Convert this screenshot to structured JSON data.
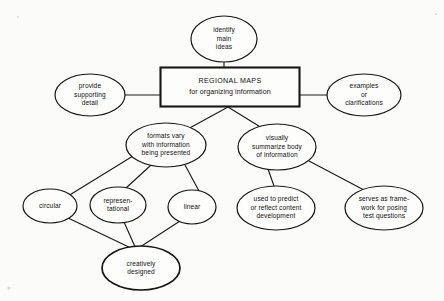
{
  "diagram": {
    "root": {
      "id": "regional-maps",
      "shape": "rectangle",
      "line1": "REGIONAL MAPS",
      "line2": "for organizing information",
      "x": 230,
      "y": 87,
      "w": 139,
      "h": 39
    },
    "nodes": [
      {
        "id": "identify-main-ideas",
        "shape": "ellipse",
        "lines": [
          "identify",
          "main",
          "ideas"
        ],
        "cx": 224,
        "cy": 39,
        "rx": 33,
        "ry": 23,
        "emphasis": "normal"
      },
      {
        "id": "provide-supporting-detail",
        "shape": "ellipse",
        "lines": [
          "provide",
          "supporting",
          "detail"
        ],
        "cx": 90,
        "cy": 95,
        "rx": 35,
        "ry": 21,
        "emphasis": "normal"
      },
      {
        "id": "examples-or-clarifications",
        "shape": "ellipse",
        "lines": [
          "examples",
          "or",
          "clarifications"
        ],
        "cx": 364,
        "cy": 95,
        "rx": 37,
        "ry": 21,
        "emphasis": "normal"
      },
      {
        "id": "formats-vary",
        "shape": "ellipse",
        "lines": [
          "formats vary",
          "with information",
          "being presented"
        ],
        "cx": 166,
        "cy": 145,
        "rx": 40,
        "ry": 22,
        "emphasis": "normal"
      },
      {
        "id": "visually-summarize",
        "shape": "ellipse",
        "lines": [
          "visually",
          "summarize body",
          "of information"
        ],
        "cx": 277,
        "cy": 147,
        "rx": 39,
        "ry": 23,
        "emphasis": "normal"
      },
      {
        "id": "circular",
        "shape": "ellipse",
        "lines": [
          "circular"
        ],
        "cx": 50,
        "cy": 206,
        "rx": 27,
        "ry": 17,
        "emphasis": "normal"
      },
      {
        "id": "representational",
        "shape": "ellipse",
        "lines": [
          "represen-",
          "tational"
        ],
        "cx": 118,
        "cy": 205,
        "rx": 28,
        "ry": 18,
        "emphasis": "normal"
      },
      {
        "id": "linear",
        "shape": "ellipse",
        "lines": [
          "linear"
        ],
        "cx": 192,
        "cy": 207,
        "rx": 24,
        "ry": 17,
        "emphasis": "normal"
      },
      {
        "id": "used-to-predict",
        "shape": "ellipse",
        "lines": [
          "used to predict",
          "or reflect content",
          "development"
        ],
        "cx": 276,
        "cy": 208,
        "rx": 39,
        "ry": 22,
        "emphasis": "normal"
      },
      {
        "id": "serves-as-framework",
        "shape": "ellipse",
        "lines": [
          "serves as frame-",
          "work for posing",
          "test questions"
        ],
        "cx": 384,
        "cy": 208,
        "rx": 39,
        "ry": 22,
        "emphasis": "normal"
      },
      {
        "id": "creatively-designed",
        "shape": "ellipse",
        "lines": [
          "creatively",
          "designed"
        ],
        "cx": 141,
        "cy": 268,
        "rx": 39,
        "ry": 22,
        "emphasis": "bold"
      }
    ],
    "edges": [
      {
        "id": "root-to-identify",
        "from": "regional-maps",
        "to": "identify-main-ideas",
        "path": "M 224 62 L 224 68"
      },
      {
        "id": "root-to-provide",
        "from": "provide-supporting-detail",
        "to": "regional-maps",
        "path": "M 125 95 L 161 95"
      },
      {
        "id": "root-to-examples",
        "from": "regional-maps",
        "to": "examples-or-clarifications",
        "path": "M 299 95 L 327 95"
      },
      {
        "id": "root-to-formats",
        "from": "regional-maps",
        "to": "formats-vary",
        "path": "M 228 107 L 186 130"
      },
      {
        "id": "root-to-visually",
        "from": "regional-maps",
        "to": "visually-summarize",
        "path": "M 228 107 L 262 128"
      },
      {
        "id": "formats-to-circular",
        "from": "formats-vary",
        "to": "circular",
        "path": "M 133 156 L 68 196"
      },
      {
        "id": "formats-to-representational",
        "from": "formats-vary",
        "to": "representational",
        "path": "M 150 166 L 126 188"
      },
      {
        "id": "formats-to-linear",
        "from": "formats-vary",
        "to": "linear",
        "path": "M 185 165 L 199 191"
      },
      {
        "id": "circular-to-creatively",
        "from": "circular",
        "to": "creatively-designed",
        "path": "M 66 217 L 133 249"
      },
      {
        "id": "representational-to-creatively",
        "from": "representational",
        "to": "creatively-designed",
        "path": "M 124 222 L 136 249"
      },
      {
        "id": "linear-to-creatively",
        "from": "linear",
        "to": "creatively-designed",
        "path": "M 180 221 L 137 249"
      },
      {
        "id": "visually-to-used",
        "from": "visually-summarize",
        "to": "used-to-predict",
        "path": "M 268 169 L 274 186"
      },
      {
        "id": "visually-to-serves",
        "from": "visually-summarize",
        "to": "serves-as-framework",
        "path": "M 309 161 L 364 190"
      }
    ]
  }
}
